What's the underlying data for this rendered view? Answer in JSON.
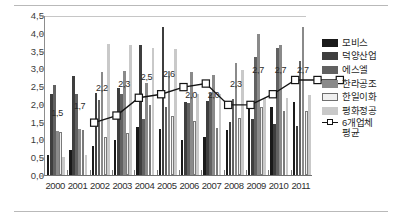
{
  "chart_data": {
    "type": "bar",
    "title": "",
    "subtitle": "",
    "xlabel": "",
    "ylabel": "",
    "categories": [
      "2000",
      "2001",
      "2002",
      "2003",
      "2004",
      "2005",
      "2006",
      "2007",
      "2008",
      "2009",
      "2010",
      "2011"
    ],
    "ylim": [
      0.0,
      4.5
    ],
    "ytick_labels": [
      "0,0",
      "0,5",
      "1,0",
      "1,5",
      "2,0",
      "2,5",
      "3,0",
      "3,5",
      "4,0",
      "4,5"
    ],
    "ytick_values": [
      0.0,
      0.5,
      1.0,
      1.5,
      2.0,
      2.5,
      3.0,
      3.5,
      4.0,
      4.5
    ],
    "grid": false,
    "legend_position": "right",
    "series": [
      {
        "name": "모비스",
        "color": "#1a1a1a",
        "values": [
          0.55,
          0.7,
          0.82,
          0.98,
          1.36,
          1.29,
          0.98,
          1.08,
          1.26,
          1.88,
          1.92,
          2.05
        ]
      },
      {
        "name": "덕양산업",
        "color": "#3e3e3e",
        "values": [
          2.27,
          2.79,
          2.32,
          2.45,
          3.66,
          4.16,
          2.05,
          2.08,
          1.49,
          1.57,
          1.43,
          1.38
        ]
      },
      {
        "name": "에스엘",
        "color": "#616161",
        "values": [
          2.54,
          2.28,
          2.1,
          2.28,
          1.58,
          1.9,
          2.02,
          2.3,
          2.13,
          3.31,
          3.57,
          3.2
        ]
      },
      {
        "name": "한라공조",
        "color": "#8a8a8a",
        "values": [
          1.25,
          1.3,
          2.91,
          2.93,
          2.6,
          2.93,
          2.9,
          2.8,
          3.15,
          3.97,
          3.66,
          4.15
        ]
      },
      {
        "name": "한일이화",
        "color": "#f0f0f0",
        "values": [
          1.21,
          1.28,
          1.07,
          1.19,
          1.96,
          1.66,
          1.52,
          1.31,
          1.59,
          1.9,
          1.79,
          1.8
        ]
      },
      {
        "name": "평화정공",
        "color": "#c9c9c9",
        "values": [
          0.5,
          0.57,
          3.68,
          3.66,
          3.56,
          3.55,
          2.28,
          2.28,
          2.96,
          2.16,
          2.18,
          2.25
        ]
      }
    ],
    "line_series": {
      "name": "6개업체 평균",
      "color": "#141414",
      "marker": "square-open",
      "values": [
        1.5,
        1.7,
        2.2,
        2.3,
        2.5,
        2.6,
        2.0,
        2.0,
        2.3,
        2.7,
        2.7,
        2.7
      ],
      "labels": [
        "1,5",
        "1,7",
        "2,2",
        "2,3",
        "2,5",
        "2,6",
        "2,0",
        "2,0",
        "2,3",
        "2,7",
        "2,7",
        "2,7"
      ]
    }
  },
  "legend": {
    "items": [
      {
        "label": "모비스"
      },
      {
        "label": "덕양산업"
      },
      {
        "label": "에스엘"
      },
      {
        "label": "한라공조"
      },
      {
        "label": "한일이화"
      },
      {
        "label": "평화정공"
      }
    ],
    "average_label_line1": "6개업체",
    "average_label_line2": "평균"
  }
}
